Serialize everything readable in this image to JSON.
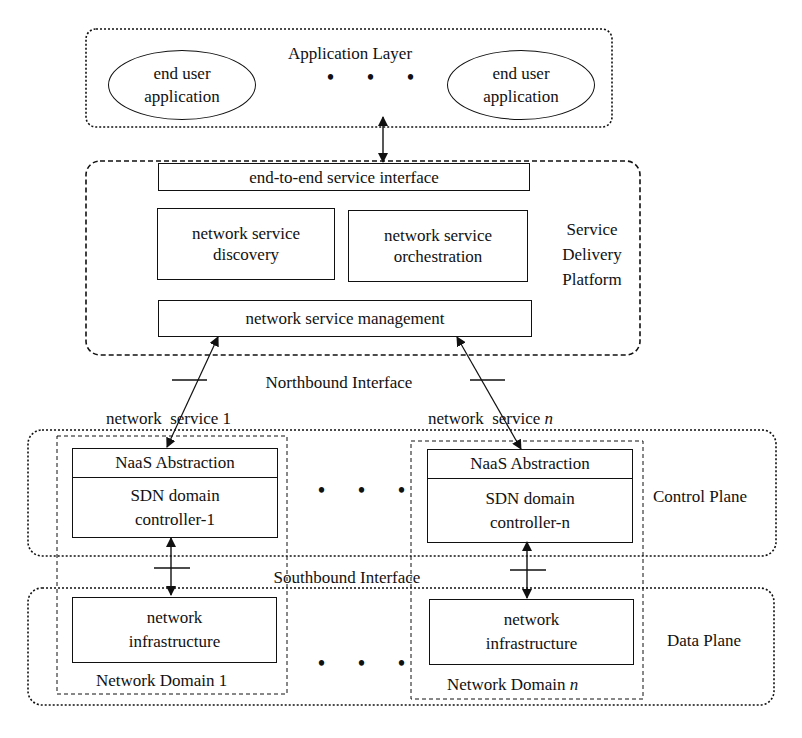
{
  "diagram": {
    "application_layer": {
      "title": "Application Layer",
      "apps": [
        {
          "line1": "end user",
          "line2": "application"
        },
        {
          "line1": "end user",
          "line2": "application"
        }
      ],
      "ellipsis": "• • •"
    },
    "service_delivery_platform": {
      "title_lines": [
        "Service",
        "Delivery",
        "Platform"
      ],
      "interface": "end-to-end service interface",
      "discovery": {
        "line1": "network service",
        "line2": "discovery"
      },
      "orchestration": {
        "line1": "network service",
        "line2": "orchestration"
      },
      "management": "network service management"
    },
    "northbound_label": "Northbound Interface",
    "southbound_label": "Southbound Interface",
    "services": [
      {
        "label": "network  service ",
        "index": "1"
      },
      {
        "label": "network  service ",
        "index": "n"
      }
    ],
    "control_plane": {
      "title": "Control Plane",
      "controllers": [
        {
          "header": "NaaS Abstraction",
          "line1": "SDN domain",
          "line2": "controller-1"
        },
        {
          "header": "NaaS Abstraction",
          "line1": "SDN domain",
          "line2": "controller-n"
        }
      ],
      "ellipsis": "• • •"
    },
    "data_plane": {
      "title": "Data Plane",
      "infrastructures": [
        {
          "line1": "network",
          "line2": "infrastructure",
          "domain": "Network Domain ",
          "index": "1"
        },
        {
          "line1": "network",
          "line2": "infrastructure",
          "domain": "Network Domain ",
          "index": "n"
        }
      ],
      "ellipsis": "• • •"
    }
  }
}
